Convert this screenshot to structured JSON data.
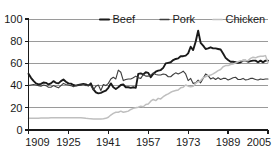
{
  "chart_data": {
    "type": "line",
    "title": "",
    "subtitle": "",
    "xlabel": "",
    "ylabel": "",
    "xlim": [
      1909,
      2005
    ],
    "ylim": [
      0,
      100
    ],
    "grid": true,
    "grid_axis": "y",
    "legend_position": "top",
    "yticks": [
      "0",
      "20",
      "40",
      "60",
      "80",
      "100"
    ],
    "ytick_values": [
      0,
      20,
      40,
      60,
      80,
      100
    ],
    "xticks": [
      "1909",
      "1925",
      "1941",
      "1957",
      "1973",
      "1989",
      "2005"
    ],
    "xtick_values": [
      1909,
      1925,
      1941,
      1957,
      1973,
      1989,
      2005
    ],
    "legend": [
      {
        "name": "Beef",
        "color": "#1a1a1a",
        "width": 1.9
      },
      {
        "name": "Pork",
        "color": "#3d3d3d",
        "width": 1.1
      },
      {
        "name": "Chicken",
        "color": "#bfbfbf",
        "width": 1.5
      }
    ],
    "x": [
      1909,
      1910,
      1911,
      1912,
      1913,
      1914,
      1915,
      1916,
      1917,
      1918,
      1919,
      1920,
      1921,
      1922,
      1923,
      1924,
      1925,
      1926,
      1927,
      1928,
      1929,
      1930,
      1931,
      1932,
      1933,
      1934,
      1935,
      1936,
      1937,
      1938,
      1939,
      1940,
      1941,
      1942,
      1943,
      1944,
      1945,
      1946,
      1947,
      1948,
      1949,
      1950,
      1951,
      1952,
      1953,
      1954,
      1955,
      1956,
      1957,
      1958,
      1959,
      1960,
      1961,
      1962,
      1963,
      1964,
      1965,
      1966,
      1967,
      1968,
      1969,
      1970,
      1971,
      1972,
      1973,
      1974,
      1975,
      1976,
      1977,
      1978,
      1979,
      1980,
      1981,
      1982,
      1983,
      1984,
      1985,
      1986,
      1987,
      1988,
      1989,
      1990,
      1991,
      1992,
      1993,
      1994,
      1995,
      1996,
      1997,
      1998,
      1999,
      2000,
      2001,
      2002,
      2003,
      2004,
      2005
    ],
    "series": [
      {
        "name": "Beef",
        "color": "#1a1a1a",
        "values": [
          50.7,
          47.0,
          44.2,
          42.0,
          41.0,
          41.5,
          42.8,
          42.5,
          41.0,
          42.0,
          44.0,
          42.5,
          42.0,
          44.0,
          45.5,
          43.5,
          42.0,
          41.8,
          40.5,
          40.0,
          40.5,
          41.0,
          41.5,
          41.0,
          40.0,
          42.0,
          36.5,
          34.0,
          33.0,
          33.5,
          34.5,
          35.5,
          38.0,
          42.0,
          38.5,
          37.0,
          38.5,
          40.5,
          41.0,
          38.5,
          38.5,
          38.0,
          38.5,
          38.0,
          50.5,
          51.0,
          50.0,
          52.0,
          51.5,
          47.5,
          50.5,
          52.5,
          53.5,
          54.0,
          56.0,
          60.0,
          60.5,
          61.0,
          63.0,
          64.0,
          64.5,
          66.5,
          66.5,
          67.0,
          69.0,
          75.0,
          72.0,
          79.5,
          89.5,
          78.5,
          76.0,
          73.0,
          73.5,
          74.5,
          73.5,
          73.5,
          73.0,
          72.5,
          69.0,
          65.0,
          63.0,
          61.5,
          61.5,
          61.0,
          60.5,
          61.0,
          62.5,
          62.5,
          61.5,
          62.0,
          62.5,
          62.5,
          61.0,
          62.5,
          61.0,
          62.5,
          62.5
        ]
      },
      {
        "name": "Pork",
        "color": "#3d3d3d",
        "values": [
          40.0,
          40.5,
          41.0,
          40.5,
          40.0,
          39.5,
          40.5,
          40.0,
          38.5,
          38.5,
          40.0,
          39.0,
          38.0,
          40.0,
          42.0,
          41.0,
          40.5,
          40.0,
          39.0,
          40.0,
          40.5,
          40.5,
          41.0,
          40.0,
          40.5,
          40.0,
          36.0,
          39.5,
          40.5,
          35.5,
          41.0,
          40.0,
          42.0,
          46.0,
          47.5,
          46.0,
          54.0,
          52.0,
          44.5,
          45.5,
          46.0,
          46.0,
          47.0,
          48.5,
          47.0,
          46.5,
          50.0,
          48.5,
          48.5,
          49.5,
          51.5,
          50.0,
          49.5,
          49.5,
          50.5,
          50.0,
          48.0,
          48.0,
          50.0,
          51.5,
          50.5,
          51.5,
          53.0,
          50.5,
          44.5,
          46.5,
          42.0,
          42.5,
          45.0,
          42.5,
          46.5,
          50.5,
          49.0,
          46.0,
          47.0,
          45.5,
          47.0,
          45.5,
          46.5,
          46.5,
          45.0,
          46.0,
          47.0,
          47.5,
          45.5,
          45.5,
          46.5,
          45.0,
          45.5,
          46.5,
          46.5,
          45.5,
          45.0,
          46.0,
          45.5,
          46.0,
          46.0
        ]
      },
      {
        "name": "Chicken",
        "color": "#bfbfbf",
        "values": [
          10.5,
          10.5,
          10.5,
          10.6,
          10.6,
          10.7,
          10.8,
          10.8,
          10.9,
          11.0,
          11.0,
          11.0,
          11.0,
          11.0,
          11.0,
          11.0,
          11.0,
          11.0,
          11.0,
          11.0,
          11.0,
          11.0,
          10.8,
          10.5,
          10.3,
          10.2,
          10.0,
          10.0,
          10.0,
          10.0,
          10.2,
          10.5,
          11.5,
          13.5,
          15.0,
          16.0,
          16.0,
          17.0,
          16.0,
          16.5,
          17.0,
          18.5,
          19.5,
          20.0,
          20.5,
          21.5,
          21.0,
          23.0,
          23.5,
          26.0,
          27.5,
          26.5,
          28.5,
          28.0,
          30.0,
          31.5,
          32.5,
          34.0,
          35.0,
          35.5,
          36.0,
          38.0,
          38.5,
          40.5,
          39.5,
          39.0,
          39.5,
          42.0,
          43.5,
          44.5,
          47.0,
          48.0,
          49.0,
          49.5,
          50.5,
          52.0,
          53.5,
          54.5,
          57.0,
          58.0,
          58.0,
          59.0,
          59.5,
          60.5,
          61.5,
          62.5,
          62.5,
          62.5,
          62.5,
          64.5,
          65.5,
          65.0,
          66.0,
          66.5,
          66.5,
          67.0,
          60.5
        ]
      }
    ]
  },
  "axes": {
    "y_axis_name": "y-axis",
    "x_axis_name": "x-axis"
  }
}
